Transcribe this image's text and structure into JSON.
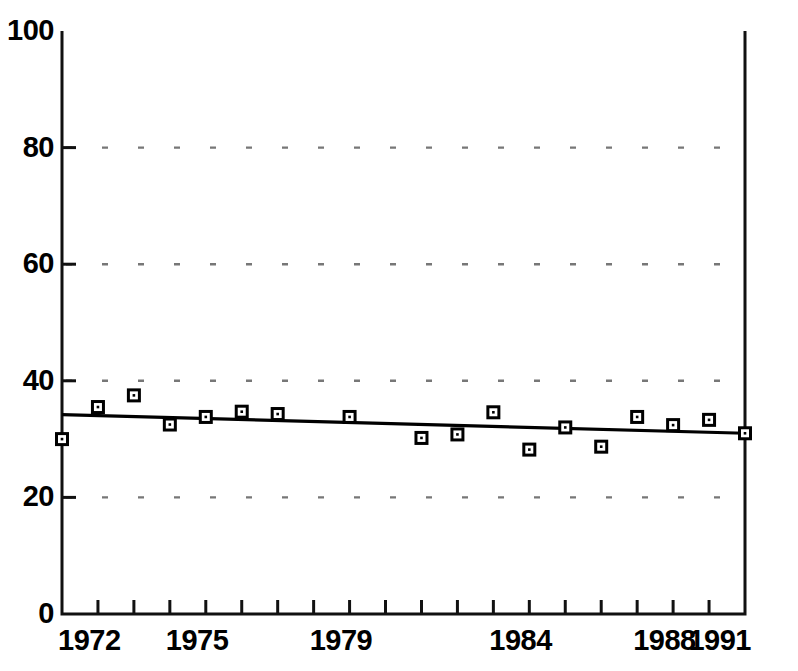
{
  "chart_data": {
    "type": "scatter",
    "title": "",
    "subtitle": "",
    "xlabel": "",
    "ylabel": "",
    "xlim": [
      1972,
      1991
    ],
    "ylim": [
      0,
      100
    ],
    "grid": true,
    "grid_style": "dotted-horizontal",
    "legend": "none",
    "x_tick_labels": [
      "1972",
      "1975",
      "1979",
      "1984",
      "1988",
      "1991"
    ],
    "x_tick_label_values": [
      1972,
      1975,
      1979,
      1984,
      1988,
      1991
    ],
    "x_tick_values": [
      1972,
      1973,
      1974,
      1975,
      1976,
      1977,
      1978,
      1979,
      1980,
      1981,
      1982,
      1983,
      1984,
      1985,
      1986,
      1987,
      1988,
      1989,
      1990,
      1991
    ],
    "y_tick_labels": [
      "0",
      "20",
      "40",
      "60",
      "80",
      "100"
    ],
    "y_tick_values": [
      0,
      20,
      40,
      60,
      80,
      100
    ],
    "series": [
      {
        "name": "observations",
        "type": "scatter",
        "marker": "open-square",
        "color": "#000000",
        "x": [
          1972,
          1973,
          1974,
          1975,
          1976,
          1977,
          1978,
          1980,
          1982,
          1983,
          1984,
          1985,
          1986,
          1987,
          1988,
          1989,
          1990,
          1991
        ],
        "values": [
          30.0,
          35.5,
          37.5,
          32.5,
          33.8,
          34.7,
          34.3,
          33.8,
          30.2,
          30.8,
          34.6,
          28.2,
          32.0,
          28.7,
          33.8,
          32.4,
          33.3,
          31.0
        ]
      },
      {
        "name": "trend-line",
        "type": "line",
        "color": "#000000",
        "x": [
          1972,
          1991
        ],
        "values": [
          34.2,
          31.0
        ]
      }
    ]
  }
}
